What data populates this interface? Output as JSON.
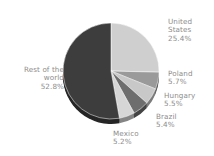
{
  "chart_data": {
    "type": "pie",
    "title": "",
    "subtitle": "",
    "xlabel": "",
    "ylabel": "",
    "legend_position": "none",
    "labels_position": "outside-radial",
    "start_angle_deg": 0,
    "direction": "clockwise",
    "categories": [
      "United States",
      "Poland",
      "Hungary",
      "Brazil",
      "Mexico",
      "Rest of the world"
    ],
    "values": [
      25.4,
      5.7,
      5.5,
      5.4,
      5.2,
      52.8
    ],
    "value_suffix": "%",
    "colors": [
      "#cfcfcf",
      "#9a9a9a",
      "#c8c8c8",
      "#6e6e6e",
      "#d6d6d6",
      "#3d3d3d"
    ],
    "slices": [
      {
        "name": "United States",
        "value": 25.4,
        "label": "United States",
        "percent_text": "25.4%",
        "color": "#cfcfcf"
      },
      {
        "name": "Poland",
        "value": 5.7,
        "label": "Poland",
        "percent_text": "5.7%",
        "color": "#9a9a9a"
      },
      {
        "name": "Hungary",
        "value": 5.5,
        "label": "Hungary",
        "percent_text": "5.5%",
        "color": "#c8c8c8"
      },
      {
        "name": "Brazil",
        "value": 5.4,
        "label": "Brazil",
        "percent_text": "5.4%",
        "color": "#6e6e6e"
      },
      {
        "name": "Mexico",
        "value": 5.2,
        "label": "Mexico",
        "percent_text": "5.2%",
        "color": "#d6d6d6"
      },
      {
        "name": "Rest of the world",
        "value": 52.8,
        "label": "Rest of the world",
        "percent_text": "52.8%",
        "color": "#3d3d3d"
      }
    ]
  },
  "labels": {
    "united_states": {
      "line1": "United",
      "line2": "States",
      "pct": "25.4%"
    },
    "poland": {
      "line1": "Poland",
      "pct": "5.7%"
    },
    "hungary": {
      "line1": "Hungary",
      "pct": "5.5%"
    },
    "brazil": {
      "line1": "Brazil",
      "pct": "5.4%"
    },
    "mexico": {
      "line1": "Mexico",
      "pct": "5.2%"
    },
    "rest_of_world": {
      "line1": "Rest of the",
      "line2": "world",
      "pct": "52.8%"
    }
  },
  "style": {
    "background": "#ffffff",
    "text_color": "#8c8c8c",
    "pie_center_x": 111,
    "pie_center_y": 71,
    "pie_radius": 48,
    "depth_px": 5,
    "depth_color": "#2b2b2b"
  }
}
